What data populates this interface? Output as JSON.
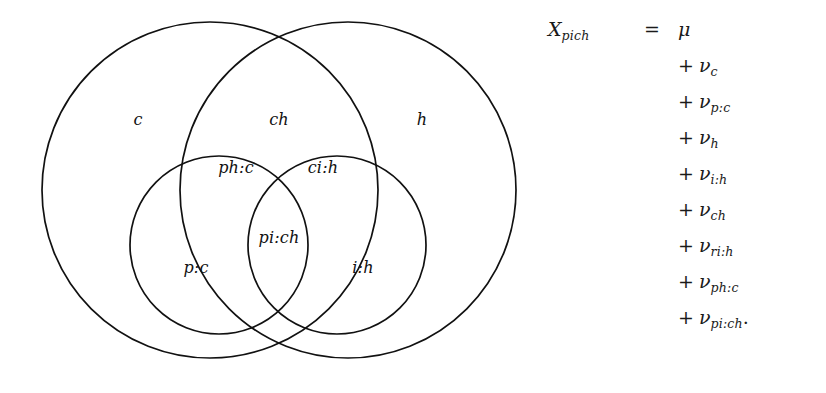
{
  "figure": {
    "type": "venn-diagram-with-equation",
    "venn": {
      "regions": [
        {
          "id": "c",
          "label": "c",
          "x": 138,
          "y": 120
        },
        {
          "id": "ch",
          "label": "ch",
          "x": 279,
          "y": 120
        },
        {
          "id": "h",
          "label": "h",
          "x": 422,
          "y": 120
        },
        {
          "id": "ph:c",
          "label": "ph:c",
          "x": 236,
          "y": 168
        },
        {
          "id": "ci:h",
          "label": "ci:h",
          "x": 323,
          "y": 168
        },
        {
          "id": "pi:ch",
          "label": "pi:ch",
          "x": 279,
          "y": 238
        },
        {
          "id": "p:c",
          "label": "p:c",
          "x": 196,
          "y": 268
        },
        {
          "id": "i:h",
          "label": "i:h",
          "x": 363,
          "y": 268
        }
      ],
      "circles": [
        {
          "id": "circle-c",
          "cx": 210,
          "cy": 190,
          "r": 168
        },
        {
          "id": "circle-h",
          "cx": 348,
          "cy": 190,
          "r": 168
        },
        {
          "id": "circle-p",
          "cx": 219,
          "cy": 245,
          "r": 89
        },
        {
          "id": "circle-i",
          "cx": 337,
          "cy": 245,
          "r": 89
        }
      ],
      "stroke_color": "#111111"
    },
    "equation": {
      "lhs": "X",
      "lhs_subscript": "pich",
      "operator": "=",
      "terms": [
        {
          "op": "",
          "symbol": "μ",
          "subscript": "",
          "trailing": ""
        },
        {
          "op": "+",
          "symbol": "ν",
          "subscript": "c",
          "trailing": ""
        },
        {
          "op": "+",
          "symbol": "ν",
          "subscript": "p:c",
          "trailing": ""
        },
        {
          "op": "+",
          "symbol": "ν",
          "subscript": "h",
          "trailing": ""
        },
        {
          "op": "+",
          "symbol": "ν",
          "subscript": "i:h",
          "trailing": ""
        },
        {
          "op": "+",
          "symbol": "ν",
          "subscript": "ch",
          "trailing": ""
        },
        {
          "op": "+",
          "symbol": "ν",
          "subscript": "ri:h",
          "trailing": ""
        },
        {
          "op": "+",
          "symbol": "ν",
          "subscript": "ph:c",
          "trailing": ""
        },
        {
          "op": "+",
          "symbol": "ν",
          "subscript": "pi:ch",
          "trailing": "."
        }
      ]
    }
  }
}
